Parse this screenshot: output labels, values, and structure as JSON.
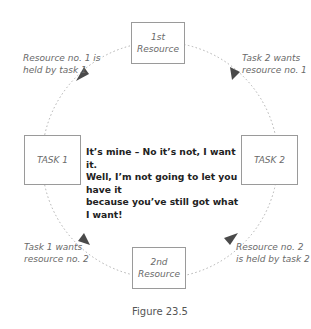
{
  "nodes": {
    "resource1": {
      "line1": "1st",
      "line2": "Resource"
    },
    "resource2": {
      "line1": "2nd",
      "line2": "Resource"
    },
    "task1": "TASK 1",
    "task2": "TASK 2"
  },
  "edge_labels": {
    "top_left": {
      "line1": "Resource no. 1 is",
      "line2": "held by task 1"
    },
    "top_right": {
      "line1": "Task 2 wants",
      "line2": "resource no. 1"
    },
    "bottom_left": {
      "line1": "Task 1 wants",
      "line2": "resource no. 2"
    },
    "bottom_right": {
      "line1": "Resource no. 2",
      "line2": "is held by task 2"
    }
  },
  "dialogue": {
    "line1": "It’s mine – No it’s not, I want it.",
    "line2": "Well, I’m not going to let you have it",
    "line3": "because you’ve still got what I want!"
  },
  "caption": "Figure 23.5",
  "colors": {
    "circle": "#b0b0b0",
    "arrow": "#4a4a4a",
    "box_border": "#9a9a9a"
  }
}
